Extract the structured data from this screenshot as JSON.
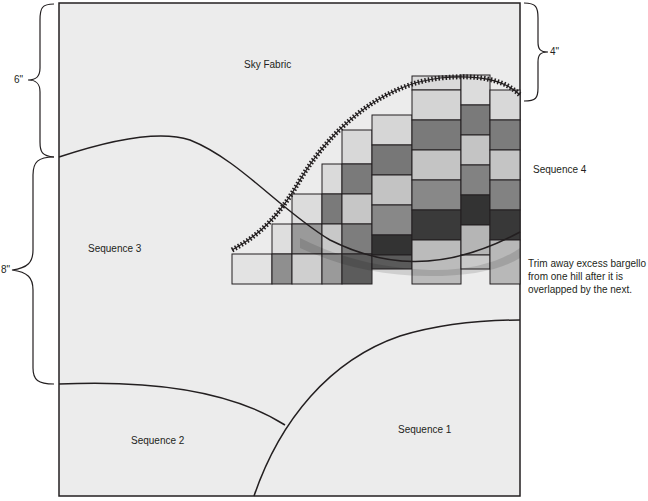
{
  "diagram": {
    "colors": {
      "sky": "#ececec",
      "outline": "#231f20",
      "cell_light": "#d9d9d9",
      "cell_mid_light": "#bdbdbd",
      "cell_mid": "#8f8f8f",
      "cell_mid_dark": "#6e6e6e",
      "cell_dark": "#3d3d3d"
    },
    "labels": {
      "sky": "Sky Fabric",
      "seq1": "Sequence 1",
      "seq2": "Sequence 2",
      "seq3": "Sequence 3",
      "seq4": "Sequence 4"
    },
    "dimensions": {
      "left_top": "6\"",
      "left_bottom": "8\"",
      "right_top": "4\""
    },
    "note": "Trim away excess bargello from one hill after it is overlapped by the next."
  }
}
